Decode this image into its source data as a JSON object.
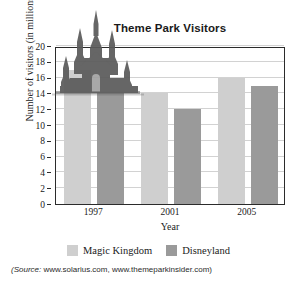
{
  "chart_data": {
    "type": "bar",
    "title": "Theme Park Visitors",
    "xlabel": "Year",
    "ylabel": "Number of visitors (in millions)",
    "categories": [
      "1997",
      "2001",
      "2005"
    ],
    "series": [
      {
        "name": "Magic Kingdom",
        "color": "#cfcfcf",
        "values": [
          17,
          14,
          16
        ]
      },
      {
        "name": "Disneyland",
        "color": "#9a9a9a",
        "values": [
          14,
          12,
          15
        ]
      }
    ],
    "ylim": [
      0,
      20
    ],
    "ytick_step": 2,
    "yticks": [
      0,
      2,
      4,
      6,
      8,
      10,
      12,
      14,
      16,
      18,
      20
    ],
    "grid": true,
    "legend_position": "bottom"
  },
  "decoration": {
    "castle_icon": "castle-silhouette-icon"
  },
  "source": {
    "prefix": "(Source:",
    "text": " www.solarius.com, www.themeparkinsider.com)"
  }
}
